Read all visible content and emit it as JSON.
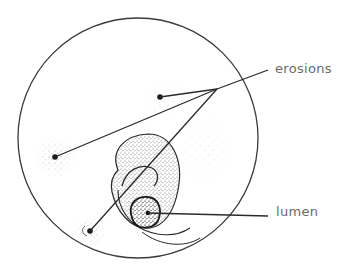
{
  "diagram": {
    "type": "anatomical cross-section illustration",
    "labels": {
      "erosions": "erosions",
      "lumen": "lumen"
    },
    "colors": {
      "outline": "#3a3a3a",
      "stipple": "#555555",
      "label_text": "#6b6b6b",
      "background": "#ffffff"
    },
    "outer_circle": {
      "cx": 138,
      "cy": 138,
      "r": 120
    },
    "erosion_points": [
      {
        "name": "upper-center",
        "x": 160,
        "y": 97
      },
      {
        "name": "left",
        "x": 55,
        "y": 157
      },
      {
        "name": "bottom-left",
        "x": 90,
        "y": 231
      }
    ],
    "erosions_leader_origin": {
      "x": 217,
      "y": 89
    },
    "lumen_point": {
      "x": 148,
      "y": 213
    }
  }
}
